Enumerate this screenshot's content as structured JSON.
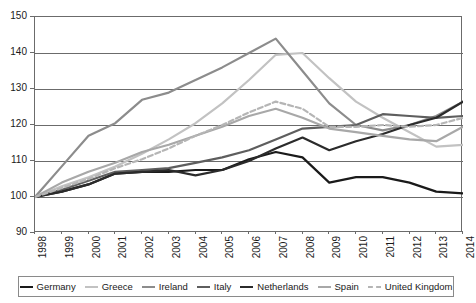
{
  "chart_data": {
    "type": "line",
    "title": "",
    "xlabel": "",
    "ylabel": "",
    "xlim": [
      1998,
      2014
    ],
    "ylim": [
      90,
      150
    ],
    "y_ticks": [
      90,
      100,
      110,
      120,
      130,
      140,
      150
    ],
    "grid": true,
    "legend_position": "bottom",
    "x": [
      1998,
      1999,
      2000,
      2001,
      2002,
      2003,
      2004,
      2005,
      2006,
      2007,
      2008,
      2009,
      2010,
      2011,
      2012,
      2013,
      2014
    ],
    "categories": [
      "1998",
      "1999",
      "2000",
      "2001",
      "2002",
      "2003",
      "2004",
      "2005",
      "2006",
      "2007",
      "2008",
      "2009",
      "2010",
      "2011",
      "2012",
      "2013",
      "2014"
    ],
    "series": [
      {
        "name": "Germany",
        "color": "#1a1a1a",
        "width": 2.2,
        "dash": "none",
        "values": [
          100,
          101.5,
          103.5,
          106.5,
          107.0,
          107.0,
          107.5,
          107.5,
          110.5,
          112.5,
          111.0,
          104.0,
          105.5,
          105.5,
          104.0,
          101.5,
          101.0
        ]
      },
      {
        "name": "Greece",
        "color": "#c2c2c2",
        "width": 2.2,
        "dash": "none",
        "values": [
          100,
          103.0,
          105.5,
          108.5,
          112.0,
          116.0,
          120.5,
          126.0,
          132.5,
          139.5,
          140.0,
          133.0,
          126.5,
          122.0,
          118.0,
          114.0,
          114.5
        ]
      },
      {
        "name": "Ireland",
        "color": "#8c8c8c",
        "width": 2.2,
        "dash": "none",
        "values": [
          100,
          108.5,
          117.0,
          120.5,
          127.0,
          129.0,
          132.5,
          136.0,
          140.0,
          144.0,
          135.0,
          126.0,
          120.0,
          118.5,
          120.0,
          122.5,
          126.5
        ]
      },
      {
        "name": "Italy",
        "color": "#5e5e5e",
        "width": 2.2,
        "dash": "none",
        "values": [
          100,
          102.0,
          104.5,
          107.0,
          107.5,
          108.0,
          109.5,
          111.0,
          113.0,
          116.0,
          119.0,
          119.5,
          120.0,
          123.0,
          122.5,
          122.0,
          122.5
        ]
      },
      {
        "name": "Netherlands",
        "color": "#2b2b2b",
        "width": 2.2,
        "dash": "none",
        "values": [
          100,
          101.5,
          103.5,
          106.5,
          107.0,
          107.5,
          106.0,
          107.5,
          110.0,
          113.5,
          116.5,
          113.0,
          115.5,
          117.5,
          120.0,
          122.0,
          126.5
        ]
      },
      {
        "name": "Spain",
        "color": "#a8a8a8",
        "width": 2.2,
        "dash": "none",
        "values": [
          100,
          104.0,
          107.0,
          109.5,
          112.5,
          114.5,
          117.0,
          119.5,
          122.5,
          124.5,
          122.0,
          119.0,
          118.0,
          117.0,
          116.0,
          115.5,
          119.5
        ]
      },
      {
        "name": "United Kingdom",
        "color": "#b5b5b5",
        "width": 2.2,
        "dash": "5,3",
        "values": [
          100,
          102.5,
          105.0,
          108.0,
          110.5,
          113.5,
          117.0,
          120.0,
          123.5,
          126.5,
          124.5,
          119.5,
          119.5,
          120.0,
          119.5,
          120.0,
          122.0
        ]
      }
    ]
  },
  "axes": {
    "y_tick_labels": [
      "150",
      "140",
      "130",
      "120",
      "110",
      "100",
      "90"
    ],
    "x_tick_labels": [
      "1998",
      "1999",
      "2000",
      "2001",
      "2002",
      "2003",
      "2004",
      "2005",
      "2006",
      "2007",
      "2008",
      "2009",
      "2010",
      "2011",
      "2012",
      "2013",
      "2014"
    ]
  },
  "legend": {
    "items": [
      {
        "label": "Germany"
      },
      {
        "label": "Greece"
      },
      {
        "label": "Ireland"
      },
      {
        "label": "Italy"
      },
      {
        "label": "Netherlands"
      },
      {
        "label": "Spain"
      },
      {
        "label": "United Kingdom"
      }
    ]
  }
}
